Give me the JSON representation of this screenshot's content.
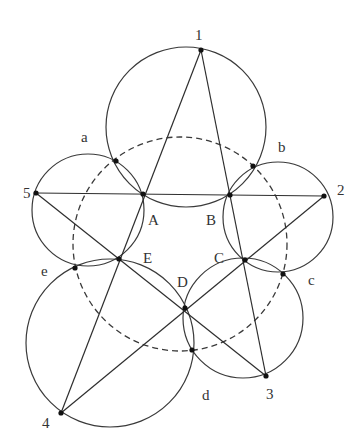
{
  "title": "",
  "colors": {
    "stroke": "#3a3a3a",
    "point": "#111111",
    "label": "#333333",
    "background": "#ffffff"
  },
  "dashed_circle": {
    "cx": 180,
    "cy": 244,
    "r": 107
  },
  "circles": [
    {
      "name": "circle-1AB",
      "cx": 186,
      "cy": 127,
      "r": 80
    },
    {
      "name": "circle-5AE",
      "cx": 88,
      "cy": 210,
      "r": 56
    },
    {
      "name": "circle-2BC",
      "cx": 278,
      "cy": 217,
      "r": 55
    },
    {
      "name": "circle-4ED",
      "cx": 110,
      "cy": 343,
      "r": 84
    },
    {
      "name": "circle-3CD",
      "cx": 243,
      "cy": 318,
      "r": 60
    }
  ],
  "points": {
    "p1": {
      "x": 201,
      "y": 50,
      "label": "1",
      "lx": 195,
      "ly": 40
    },
    "p2": {
      "x": 324,
      "y": 196,
      "label": "2",
      "lx": 337,
      "ly": 195
    },
    "p3": {
      "x": 266,
      "y": 376,
      "label": "3",
      "lx": 266,
      "ly": 399
    },
    "p4": {
      "x": 61,
      "y": 413,
      "label": "4",
      "lx": 42,
      "ly": 428
    },
    "p5": {
      "x": 36,
      "y": 193,
      "label": "5",
      "lx": 23,
      "ly": 198
    },
    "A": {
      "x": 143,
      "y": 194,
      "label": "A",
      "lx": 148,
      "ly": 225
    },
    "B": {
      "x": 230,
      "y": 195,
      "label": "B",
      "lx": 206,
      "ly": 225
    },
    "C": {
      "x": 245,
      "y": 260,
      "label": "C",
      "lx": 214,
      "ly": 263
    },
    "D": {
      "x": 185,
      "y": 308,
      "label": "D",
      "lx": 177,
      "ly": 287
    },
    "E": {
      "x": 119,
      "y": 259,
      "label": "E",
      "lx": 143,
      "ly": 263
    },
    "a": {
      "x": 116,
      "y": 161,
      "label": "a",
      "lx": 81,
      "ly": 142
    },
    "b": {
      "x": 253,
      "y": 166,
      "label": "b",
      "lx": 278,
      "ly": 152
    },
    "c": {
      "x": 283,
      "y": 274,
      "label": "c",
      "lx": 308,
      "ly": 285
    },
    "d": {
      "x": 192,
      "y": 350,
      "label": "d",
      "lx": 202,
      "ly": 400
    },
    "e": {
      "x": 75,
      "y": 268,
      "label": "e",
      "lx": 41,
      "ly": 276
    }
  },
  "segments": [
    [
      "p1",
      "p4"
    ],
    [
      "p1",
      "p3"
    ],
    [
      "p5",
      "p2"
    ],
    [
      "p5",
      "p3"
    ],
    [
      "p4",
      "p2"
    ]
  ]
}
